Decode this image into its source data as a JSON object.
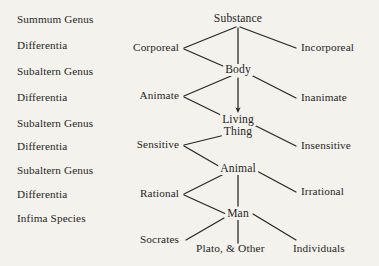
{
  "diagram": {
    "background_color": "#f4f2ed",
    "ink_color": "#262626"
  },
  "terms_column": {
    "heading": "Scholastic terminology",
    "items": [
      {
        "label": "Summum Genus"
      },
      {
        "label": "Differentia"
      },
      {
        "label": "Subaltern Genus"
      },
      {
        "label": "Differentia"
      },
      {
        "label": "Subaltern Genus"
      },
      {
        "label": "Differentia"
      },
      {
        "label": "Subaltern Genus"
      },
      {
        "label": "Differentia"
      },
      {
        "label": "Infima Species"
      }
    ]
  },
  "spine": {
    "nodes": [
      {
        "label": "Substance"
      },
      {
        "label": "Body"
      },
      {
        "label": "Living"
      },
      {
        "label": "Thing"
      },
      {
        "label": "Animal"
      },
      {
        "label": "Man"
      }
    ]
  },
  "differentiae_left": [
    {
      "label": "Corporeal"
    },
    {
      "label": "Animate"
    },
    {
      "label": "Sensitive"
    },
    {
      "label": "Rational"
    },
    {
      "label": "Socrates"
    }
  ],
  "differentiae_right": [
    {
      "label": "Incorporeal"
    },
    {
      "label": "Inanimate"
    },
    {
      "label": "Insensitive"
    },
    {
      "label": "Irrational"
    },
    {
      "label": "Individuals"
    }
  ],
  "bottom_row": {
    "individuals_label": "Plato, & Other"
  }
}
